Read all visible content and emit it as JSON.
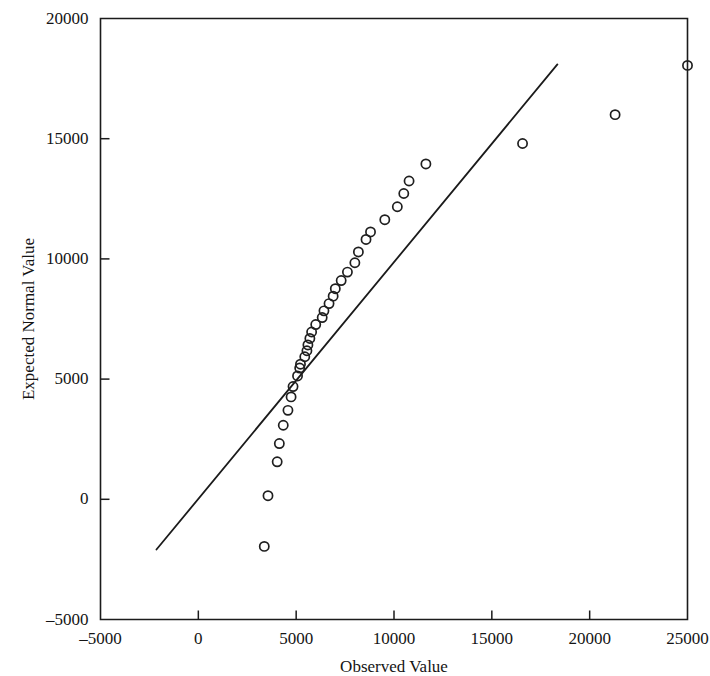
{
  "chart_data": {
    "type": "scatter",
    "title": "",
    "xlabel": "Observed Value",
    "ylabel": "Expected Normal Value",
    "xlim": [
      -5000,
      25000
    ],
    "ylim": [
      -5000,
      20000
    ],
    "xticks": [
      -5000,
      0,
      5000,
      10000,
      15000,
      20000,
      25000
    ],
    "yticks": [
      -5000,
      0,
      5000,
      10000,
      15000,
      20000
    ],
    "xtick_labels": [
      "–5000",
      "0",
      "5000",
      "10000",
      "15000",
      "20000",
      "25000"
    ],
    "ytick_labels": [
      "–5000",
      "0",
      "5000",
      "10000",
      "15000",
      "20000"
    ],
    "grid": false,
    "legend": null,
    "marker": "open-circle",
    "series": [
      {
        "name": "Expected Normal Value vs Observed Value",
        "points": [
          [
            3370,
            -1960
          ],
          [
            3560,
            150
          ],
          [
            4030,
            1560
          ],
          [
            4140,
            2320
          ],
          [
            4340,
            3080
          ],
          [
            4580,
            3700
          ],
          [
            4740,
            4260
          ],
          [
            4840,
            4690
          ],
          [
            5070,
            5130
          ],
          [
            5180,
            5460
          ],
          [
            5220,
            5620
          ],
          [
            5440,
            5930
          ],
          [
            5550,
            6180
          ],
          [
            5600,
            6420
          ],
          [
            5700,
            6690
          ],
          [
            5790,
            6960
          ],
          [
            6000,
            7270
          ],
          [
            6330,
            7560
          ],
          [
            6420,
            7840
          ],
          [
            6680,
            8140
          ],
          [
            6890,
            8450
          ],
          [
            7000,
            8760
          ],
          [
            7300,
            9100
          ],
          [
            7620,
            9450
          ],
          [
            8000,
            9840
          ],
          [
            8180,
            10290
          ],
          [
            8570,
            10810
          ],
          [
            8800,
            11120
          ],
          [
            9530,
            11630
          ],
          [
            10170,
            12170
          ],
          [
            10500,
            12720
          ],
          [
            10770,
            13240
          ],
          [
            11630,
            13950
          ],
          [
            16570,
            14800
          ],
          [
            21300,
            16000
          ],
          [
            25000,
            18050
          ]
        ]
      }
    ],
    "reference_line": {
      "name": "normal reference line",
      "x0": -2140,
      "y0": -2090,
      "x1": 18350,
      "y1": 18090
    }
  },
  "axes": {
    "x_title": "Observed Value",
    "y_title": "Expected Normal Value"
  }
}
